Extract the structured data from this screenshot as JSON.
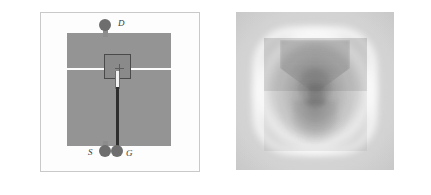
{
  "figure": {
    "panels": [
      {
        "id": "device-schematic",
        "kind": "optical-micrograph",
        "background_color": "#fdfdfd",
        "border_color": "#c9c9c9",
        "electrode_color": "#949494",
        "pad_color": "#6e6e6e",
        "lead_color": "#2e2e2e",
        "labels": [
          {
            "key": "drain",
            "text": "D"
          },
          {
            "key": "source",
            "text": "S"
          },
          {
            "key": "gate",
            "text": "G"
          }
        ],
        "elements": {
          "drain_electrode": "upper metal pad",
          "source_electrode": "lower metal pad",
          "channel_gap": "horizontal gap between pads",
          "gate_square": "dark outlined square over the channel",
          "gate_crosshair": "crosshair marker",
          "gate_finger": "vertical gate finger",
          "gate_lead": "gate lead to bond pad"
        }
      },
      {
        "id": "field-map",
        "kind": "grayscale-field-map",
        "background_color": "#c8c8c8",
        "halo_color": "#ffffff",
        "dark_region_color": "#5a5a5a",
        "description": "rounded-square bright halo enclosing a darker square overlay with lobed field pattern"
      }
    ]
  },
  "chart_data": {
    "type": "heatmap",
    "title": "",
    "xlabel": "",
    "ylabel": "",
    "colormap": "grayscale",
    "panels": [
      {
        "name": "Device micrograph",
        "features": [
          "D pad",
          "S pad",
          "G pad",
          "drain electrode",
          "source electrode",
          "gate square",
          "gate lead"
        ]
      },
      {
        "name": "Scanning field map",
        "features": [
          "bright rounded-square halo ring",
          "dark square electrode footprint",
          "central lobed dark core"
        ]
      }
    ]
  }
}
